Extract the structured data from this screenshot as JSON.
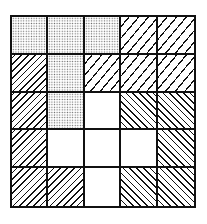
{
  "diagram": {
    "type": "pattern-grid",
    "rows": 5,
    "columns": 5,
    "legend_of_patterns": {
      "dot": "stippled dots",
      "fwd-sparse": "sparse forward diagonal hatch",
      "fwd-dense": "dense forward diagonal hatch",
      "back": "backward diagonal hatch",
      "blank": "empty white"
    },
    "cells": [
      [
        "dot",
        "dot",
        "dot",
        "fwd-sparse",
        "fwd-sparse"
      ],
      [
        "fwd-dense",
        "dot",
        "fwd-sparse",
        "fwd-sparse",
        "fwd-sparse"
      ],
      [
        "fwd-dense",
        "dot",
        "blank",
        "back",
        "back"
      ],
      [
        "fwd-dense",
        "blank",
        "blank",
        "blank",
        "back"
      ],
      [
        "fwd-dense",
        "fwd-dense",
        "blank",
        "back",
        "back"
      ]
    ],
    "colors": {
      "line": "#111111",
      "background": "#ffffff",
      "dot": "#6a6a6a"
    }
  }
}
